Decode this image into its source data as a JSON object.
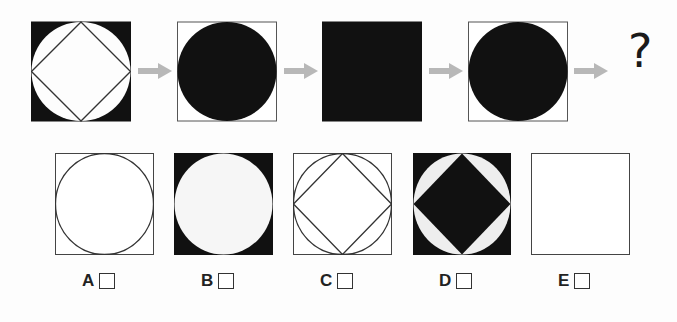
{
  "sequence": {
    "figures": [
      {
        "id": "seq-1",
        "description": "black square, white inscribed circle, outlined diamond inside"
      },
      {
        "id": "seq-2",
        "description": "white square, black inscribed circle"
      },
      {
        "id": "seq-3",
        "description": "solid black square"
      },
      {
        "id": "seq-4",
        "description": "white square, black inscribed circle"
      }
    ],
    "question_mark": "?",
    "arrow_color": "#b8b8b8"
  },
  "options": [
    {
      "letter": "A",
      "description": "white square, outlined circle"
    },
    {
      "letter": "B",
      "description": "black square, white circle"
    },
    {
      "letter": "C",
      "description": "white square, outlined circle and diamond"
    },
    {
      "letter": "D",
      "description": "black square, white circle, black diamond"
    },
    {
      "letter": "E",
      "description": "empty white square"
    }
  ],
  "colors": {
    "fill": "#111111",
    "stroke": "#333333",
    "background": "#fdfdfd"
  }
}
